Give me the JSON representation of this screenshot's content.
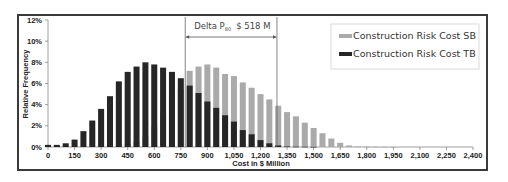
{
  "chart_data": {
    "type": "bar",
    "title": "",
    "xlabel": "Cost in $ Million",
    "ylabel": "Relative Frequency",
    "xlim": [
      0,
      2400
    ],
    "ylim": [
      0,
      12
    ],
    "x_ticks": [
      0,
      150,
      300,
      450,
      600,
      750,
      900,
      1050,
      1200,
      1350,
      1500,
      1650,
      1800,
      1950,
      2100,
      2250,
      2400
    ],
    "x_tick_labels": [
      "0",
      "150",
      "300",
      "450",
      "600",
      "750",
      "900",
      "1,050",
      "1,200",
      "1,350",
      "1,500",
      "1,650",
      "1,800",
      "1,950",
      "2,100",
      "2,250",
      "2,400"
    ],
    "y_ticks": [
      0,
      2,
      4,
      6,
      8,
      10,
      12
    ],
    "y_tick_labels": [
      "0%",
      "2%",
      "4%",
      "6%",
      "8%",
      "10%",
      "12%"
    ],
    "grid": false,
    "legend_position": "top-right",
    "x": [
      0,
      50,
      100,
      150,
      200,
      250,
      300,
      350,
      400,
      450,
      500,
      550,
      600,
      650,
      700,
      750,
      800,
      850,
      900,
      950,
      1000,
      1050,
      1100,
      1150,
      1200,
      1250,
      1300,
      1350,
      1400,
      1450,
      1500,
      1550,
      1600,
      1650,
      1700,
      1750,
      1800,
      1850,
      1900,
      1950,
      2000,
      2050,
      2100,
      2150,
      2200,
      2250,
      2300,
      2350,
      2400
    ],
    "series": [
      {
        "name": "Construction Risk Cost SB",
        "color": "#aaaaaa",
        "values": [
          0,
          0,
          0,
          0,
          0,
          0,
          0.05,
          0.1,
          0.2,
          0.3,
          0.5,
          1.0,
          1.9,
          3.2,
          4.8,
          5.5,
          7.2,
          7.6,
          7.8,
          7.5,
          6.9,
          6.7,
          6.1,
          5.6,
          5.0,
          4.5,
          3.9,
          3.3,
          2.9,
          2.3,
          1.8,
          1.3,
          0.8,
          0.4,
          0.15,
          0.05,
          0.03,
          0.02,
          0.01,
          0.01,
          0,
          0,
          0,
          0,
          0,
          0,
          0,
          0,
          0
        ]
      },
      {
        "name": "Construction Risk Cost TB",
        "color": "#262626",
        "values": [
          0.2,
          0.2,
          0.35,
          0.7,
          1.5,
          2.5,
          3.6,
          4.8,
          6.2,
          7.1,
          7.6,
          8.0,
          7.8,
          7.5,
          7.1,
          6.5,
          5.8,
          5.1,
          4.3,
          3.7,
          3.0,
          2.4,
          1.6,
          1.2,
          0.65,
          0.35,
          0.15,
          0.05,
          0.03,
          0.02,
          0.01,
          0,
          0,
          0,
          0,
          0,
          0,
          0,
          0,
          0,
          0,
          0,
          0,
          0,
          0,
          0,
          0,
          0,
          0
        ]
      }
    ],
    "annotations": [
      {
        "type": "range-arrow",
        "label_main": "Delta P",
        "label_sub": "80",
        "label_value": "$ 518 M",
        "x_start": 775,
        "x_end": 1293
      }
    ]
  }
}
